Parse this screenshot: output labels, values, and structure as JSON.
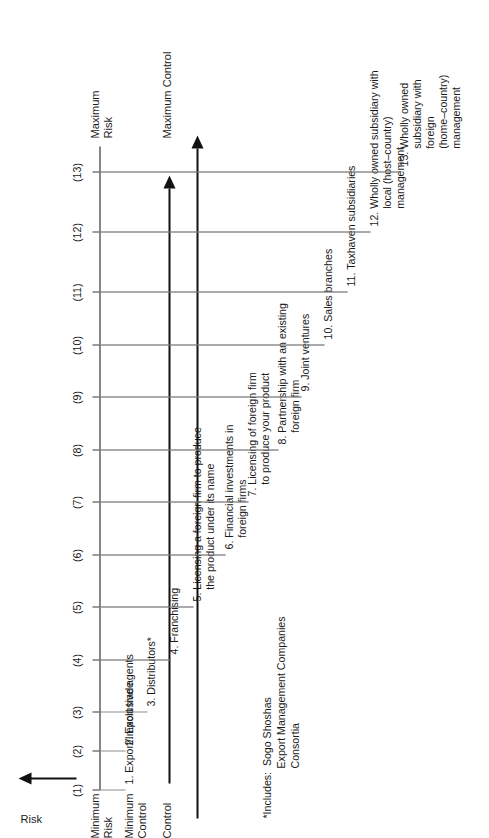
{
  "figure": {
    "axis_title": "Risk",
    "axis_top_label": "Maximum\nRisk",
    "axis_bottom_label": "Minimum\nRisk",
    "control_min_label": "Minimum\nControl",
    "control_label": "Control",
    "control_max_label": "Maximum Control",
    "line_color": "#8d8d8d",
    "axis_color": "#111111",
    "text_color": "#1a1a1a"
  },
  "ticks": [
    {
      "n": 1,
      "label": "(1)"
    },
    {
      "n": 2,
      "label": "(2)"
    },
    {
      "n": 3,
      "label": "(3)"
    },
    {
      "n": 4,
      "label": "(4)"
    },
    {
      "n": 5,
      "label": "(5)"
    },
    {
      "n": 6,
      "label": "(6)"
    },
    {
      "n": 7,
      "label": "(7)"
    },
    {
      "n": 8,
      "label": "(8)"
    },
    {
      "n": 9,
      "label": "(9)"
    },
    {
      "n": 10,
      "label": "(10)"
    },
    {
      "n": 11,
      "label": "(11)"
    },
    {
      "n": 12,
      "label": "(12)"
    },
    {
      "n": 13,
      "label": "(13)"
    }
  ],
  "items": [
    {
      "n": 1,
      "text": "1. Export/Import trade"
    },
    {
      "n": 2,
      "text": "2. Exclusive agents"
    },
    {
      "n": 3,
      "text": "3. Distributors*"
    },
    {
      "n": 4,
      "text": "4. Franchising"
    },
    {
      "n": 5,
      "text": "5. Licensing a foreign firm to produce\n    the product under its name"
    },
    {
      "n": 6,
      "text": "6. Financial investments in\n    foreign firms"
    },
    {
      "n": 7,
      "text": "7. Licensing of foreign firm\n    to produce your product"
    },
    {
      "n": 8,
      "text": "8. Partnership with an existing\n    foreign firm"
    },
    {
      "n": 9,
      "text": "9. Joint ventures"
    },
    {
      "n": 10,
      "text": "10. Sales branches"
    },
    {
      "n": 11,
      "text": "11. Taxhaven subsidiaries"
    },
    {
      "n": 12,
      "text": "12. Wholly owned subsidiary with\n      local (host–country)\n      management"
    },
    {
      "n": 13,
      "text": "13. Wholly owned\n      subsidiary with\n      foreign\n      (home–country)\n      management"
    }
  ],
  "footnote": {
    "text": "*Includes:  Sogo Shoshas\n                 Export Management Companies\n                 Consortia"
  },
  "chart_data": {
    "type": "line",
    "xlabel": "Risk",
    "ylabel": "Control",
    "x": [
      1,
      2,
      3,
      4,
      5,
      6,
      7,
      8,
      9,
      10,
      11,
      12,
      13
    ],
    "tick_labels": [
      "(1)",
      "(2)",
      "(3)",
      "(4)",
      "(5)",
      "(6)",
      "(7)",
      "(8)",
      "(9)",
      "(10)",
      "(11)",
      "(12)",
      "(13)"
    ],
    "categories": [
      "1. Export/Import trade",
      "2. Exclusive agents",
      "3. Distributors*",
      "4. Franchising",
      "5. Licensing a foreign firm to produce the product under its name",
      "6. Financial investments in foreign firms",
      "7. Licensing of foreign firm to produce your product",
      "8. Partnership with an existing foreign firm",
      "9. Joint ventures",
      "10. Sales branches",
      "11. Taxhaven subsidiaries",
      "12. Wholly owned subsidiary with local (host–country) management",
      "13. Wholly owned subsidiary with foreign (home–country) management"
    ],
    "axis_endpoints": {
      "low": "Minimum Risk / Minimum Control",
      "high": "Maximum Risk / Maximum Control"
    },
    "grid": false,
    "legend": "none"
  }
}
